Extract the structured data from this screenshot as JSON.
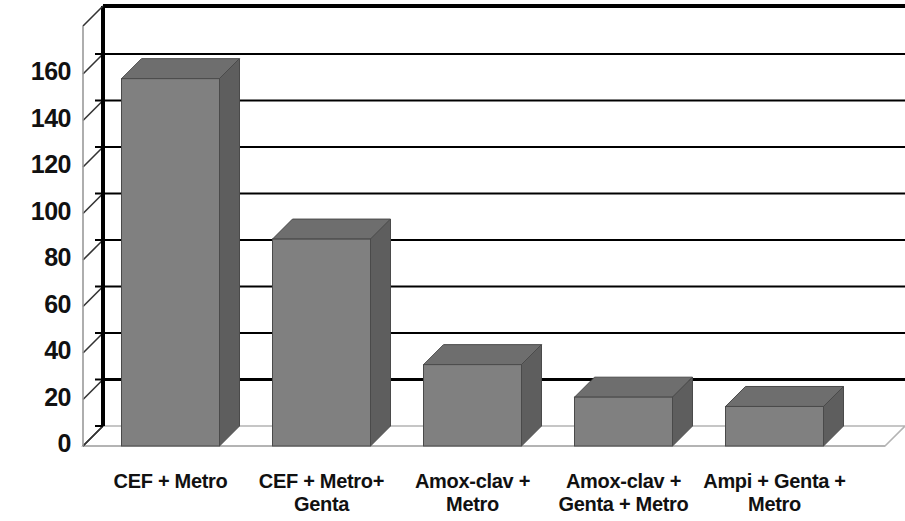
{
  "chart_data": {
    "type": "bar",
    "title": "",
    "subtitle": "",
    "xlabel": "",
    "ylabel": "",
    "categories": [
      "CEF + Metro",
      "CEF + Metro+ Genta",
      "Amox-clav + Metro",
      "Amox-clav + Genta + Metro",
      "Ampi + Genta + Metro"
    ],
    "category_lines": [
      [
        "CEF + Metro"
      ],
      [
        "CEF + Metro+",
        "Genta"
      ],
      [
        "Amox-clav +",
        "Metro"
      ],
      [
        "Amox-clav +",
        "Genta + Metro"
      ],
      [
        "Ampi + Genta +",
        "Metro"
      ]
    ],
    "values": [
      158,
      89,
      35,
      21,
      17
    ],
    "ylim": [
      0,
      160
    ],
    "ytick_labels": [
      "0",
      "20",
      "40",
      "60",
      "80",
      "100",
      "120",
      "140",
      "160"
    ],
    "ytick_values": [
      0,
      20,
      40,
      60,
      80,
      100,
      120,
      140,
      160
    ],
    "grid": true,
    "legend": false,
    "legend_position": "none",
    "style": "3d-column",
    "colors": {
      "bar_front": "#808080",
      "bar_top": "#6e6e6e",
      "bar_side": "#5e5e5e",
      "axis": "#000000",
      "gridline": "#000000",
      "floor_edge": "#b4b4b4",
      "background": "#ffffff",
      "text": "#111111"
    }
  },
  "axis": {
    "y_ticks": [
      {
        "label": "160",
        "value": 160
      },
      {
        "label": "140",
        "value": 140
      },
      {
        "label": "120",
        "value": 120
      },
      {
        "label": "100",
        "value": 100
      },
      {
        "label": "80",
        "value": 80
      },
      {
        "label": "60",
        "value": 60
      },
      {
        "label": "40",
        "value": 40
      },
      {
        "label": "20",
        "value": 20
      },
      {
        "label": "0",
        "value": 0
      }
    ]
  },
  "bars": [
    {
      "label": "CEF + Metro",
      "value": 158
    },
    {
      "label": "CEF + Metro+ Genta",
      "value": 89
    },
    {
      "label": "Amox-clav + Metro",
      "value": 35
    },
    {
      "label": "Amox-clav + Genta + Metro",
      "value": 21
    },
    {
      "label": "Ampi + Genta + Metro",
      "value": 17
    }
  ],
  "category_labels": [
    {
      "line1": "CEF + Metro",
      "line2": ""
    },
    {
      "line1": "CEF + Metro+",
      "line2": "Genta"
    },
    {
      "line1": "Amox-clav +",
      "line2": "Metro"
    },
    {
      "line1": "Amox-clav +",
      "line2": "Genta + Metro"
    },
    {
      "line1": "Ampi + Genta +",
      "line2": "Metro"
    }
  ]
}
